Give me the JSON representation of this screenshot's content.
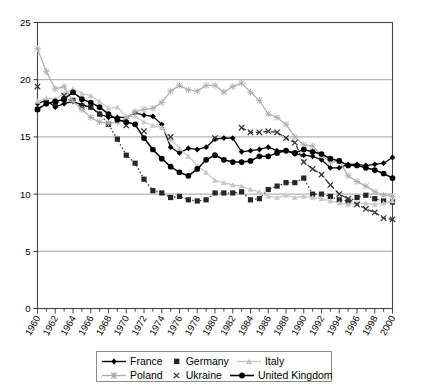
{
  "chart_data": {
    "type": "line",
    "title": "",
    "xlabel": "",
    "ylabel": "",
    "xlim": [
      1960,
      2000
    ],
    "ylim": [
      0,
      25
    ],
    "yticks": [
      0,
      5,
      10,
      15,
      20,
      25
    ],
    "xticks": [
      1960,
      1962,
      1964,
      1966,
      1968,
      1970,
      1972,
      1974,
      1976,
      1978,
      1980,
      1982,
      1984,
      1986,
      1988,
      1990,
      1992,
      1994,
      1996,
      1998,
      2000
    ],
    "minor_x_interval": 1,
    "grid": "horizontal",
    "legend_position": "bottom",
    "x": [
      1960,
      1961,
      1962,
      1963,
      1964,
      1965,
      1966,
      1967,
      1968,
      1969,
      1970,
      1971,
      1972,
      1973,
      1974,
      1975,
      1976,
      1977,
      1978,
      1979,
      1980,
      1981,
      1982,
      1983,
      1984,
      1985,
      1986,
      1987,
      1988,
      1989,
      1990,
      1991,
      1992,
      1993,
      1994,
      1995,
      1996,
      1997,
      1998,
      1999,
      2000
    ],
    "series": [
      {
        "name": "France",
        "color": "#000000",
        "marker": "diamond",
        "line": "solid",
        "values": [
          17.9,
          18.2,
          17.6,
          17.9,
          18.1,
          17.8,
          17.6,
          17.0,
          16.7,
          16.7,
          16.7,
          17.1,
          16.9,
          16.8,
          16.1,
          14.1,
          13.6,
          14.0,
          13.9,
          14.1,
          14.8,
          14.9,
          14.9,
          13.7,
          13.8,
          13.9,
          14.1,
          13.8,
          13.8,
          13.5,
          13.4,
          13.3,
          13.0,
          12.3,
          12.3,
          12.6,
          12.6,
          12.5,
          12.6,
          12.7,
          13.2
        ]
      },
      {
        "name": "Germany",
        "color": "#262626",
        "marker": "square",
        "line": "dotted",
        "values": [
          17.4,
          18.0,
          17.9,
          18.3,
          18.2,
          17.7,
          17.6,
          17.0,
          16.1,
          14.8,
          13.4,
          12.7,
          11.3,
          10.3,
          10.1,
          9.7,
          9.8,
          9.5,
          9.4,
          9.5,
          10.1,
          10.1,
          10.1,
          10.2,
          9.5,
          9.6,
          10.4,
          10.7,
          11.0,
          11.0,
          11.4,
          10.0,
          10.0,
          9.8,
          9.5,
          9.4,
          9.7,
          9.9,
          9.6,
          9.4,
          9.3
        ]
      },
      {
        "name": "Italy",
        "color": "#c8c8c8",
        "marker": "triangle",
        "line": "solid",
        "values": [
          18.1,
          18.4,
          18.3,
          18.8,
          19.2,
          18.8,
          18.6,
          18.1,
          17.5,
          17.6,
          16.8,
          16.8,
          16.3,
          16.0,
          15.8,
          14.8,
          14.0,
          13.3,
          12.5,
          11.9,
          11.2,
          11.0,
          10.8,
          10.7,
          10.4,
          10.2,
          9.8,
          9.7,
          9.9,
          9.7,
          9.8,
          9.7,
          9.6,
          9.4,
          9.2,
          9.1,
          9.2,
          9.2,
          9.1,
          9.2,
          9.4
        ]
      },
      {
        "name": "Poland",
        "color": "#b0b0b0",
        "marker": "star",
        "line": "solid",
        "values": [
          22.7,
          20.7,
          19.2,
          19.4,
          18.1,
          17.4,
          16.7,
          16.3,
          16.2,
          16.3,
          16.6,
          17.2,
          17.4,
          17.5,
          18.0,
          19.0,
          19.5,
          19.1,
          19.0,
          19.5,
          19.5,
          18.9,
          19.4,
          19.7,
          18.9,
          18.2,
          17.0,
          16.7,
          16.1,
          15.0,
          14.3,
          14.2,
          13.4,
          12.8,
          12.9,
          11.6,
          11.1,
          10.7,
          10.2,
          9.9,
          9.8
        ]
      },
      {
        "name": "Ukraine",
        "color": "#333333",
        "marker": "x",
        "line": "dashed",
        "values": [
          19.4,
          null,
          null,
          18.6,
          null,
          null,
          null,
          null,
          null,
          null,
          16.0,
          null,
          15.5,
          null,
          null,
          15.0,
          null,
          null,
          null,
          null,
          14.9,
          null,
          null,
          15.8,
          15.4,
          15.4,
          15.5,
          15.4,
          14.9,
          14.5,
          12.8,
          12.2,
          11.7,
          10.8,
          10.0,
          9.6,
          9.1,
          8.7,
          8.4,
          7.9,
          7.8
        ]
      },
      {
        "name": "United Kingdom",
        "color": "#000000",
        "marker": "circle",
        "line": "solid",
        "values": [
          17.4,
          17.9,
          18.1,
          18.3,
          18.9,
          18.3,
          18.0,
          17.6,
          17.0,
          16.5,
          16.3,
          16.1,
          14.9,
          13.9,
          13.1,
          12.4,
          11.9,
          11.6,
          12.2,
          13.0,
          13.4,
          13.0,
          12.8,
          12.8,
          12.9,
          13.3,
          13.3,
          13.6,
          13.8,
          13.6,
          13.9,
          13.7,
          13.5,
          13.1,
          12.9,
          12.5,
          12.5,
          12.3,
          12.1,
          11.8,
          11.4
        ]
      }
    ]
  },
  "legend": {
    "items": [
      {
        "label": "France"
      },
      {
        "label": "Germany"
      },
      {
        "label": "Italy"
      },
      {
        "label": "Poland"
      },
      {
        "label": "Ukraine"
      },
      {
        "label": "United Kingdom"
      }
    ]
  }
}
